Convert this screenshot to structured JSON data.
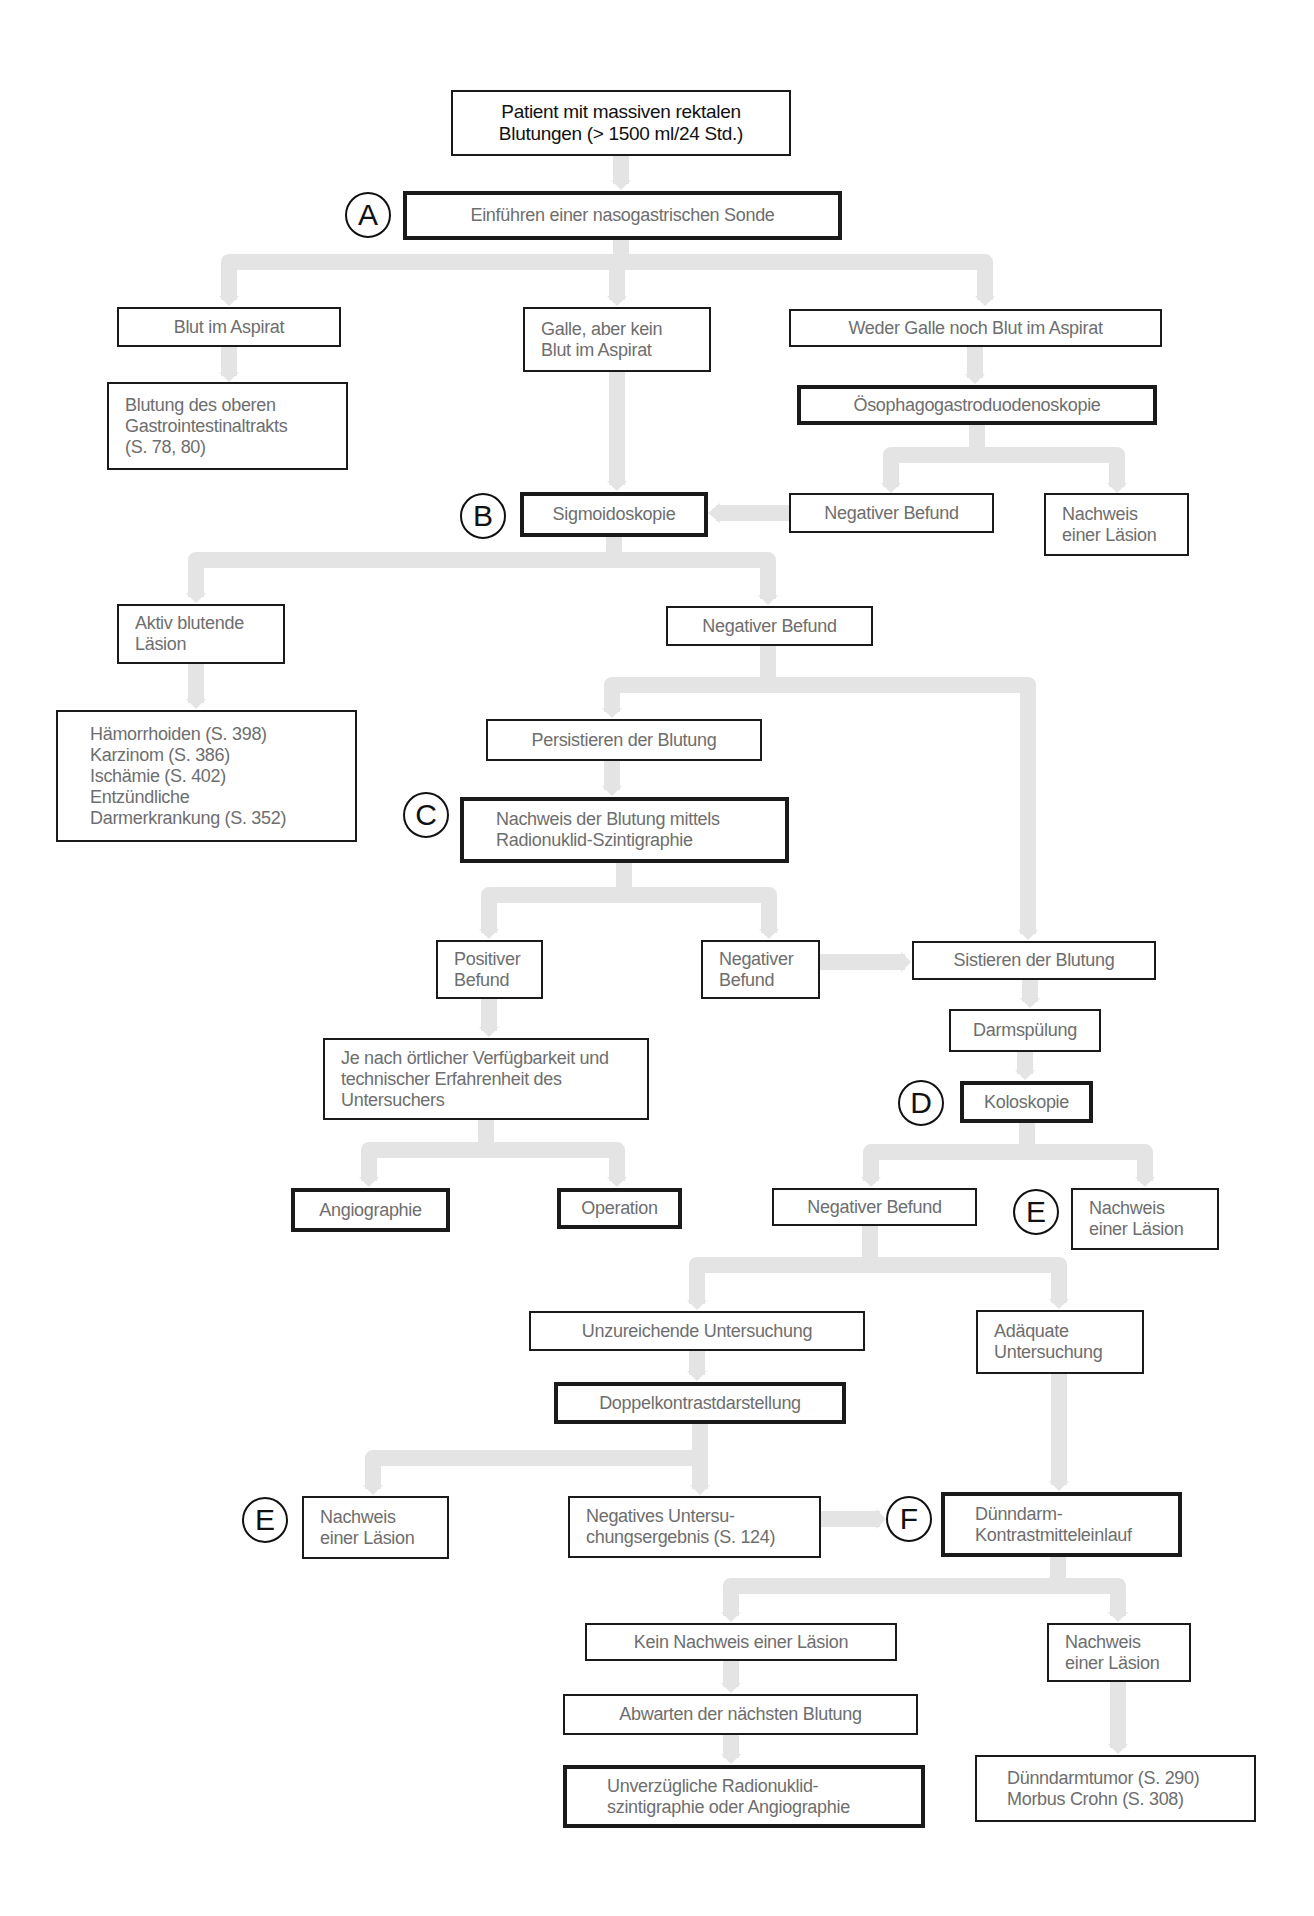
{
  "colors": {
    "connector": "#e4e4e4",
    "border": "#1a1a1a",
    "text": "#6e6e6e"
  },
  "markers": {
    "A": "A",
    "B": "B",
    "C": "C",
    "D": "D",
    "E": "E",
    "F": "F"
  },
  "nodes": {
    "start": "Patient mit massiven rektalen\nBlutungen (> 1500 ml/24 Std.)",
    "nasogastric": "Einführen einer nasogastrischen Sonde",
    "blood_aspirate": "Blut im Aspirat",
    "bile_no_blood": "Galle, aber kein\nBlut im Aspirat",
    "neither": "Weder Galle noch Blut im Aspirat",
    "upper_gi": "Blutung des oberen\nGastrointestinaltrakts\n(S. 78, 80)",
    "egd": "Ösophagogastroduodenoskopie",
    "sigmoidoscopy": "Sigmoidoskopie",
    "egd_negative": "Negativer Befund",
    "egd_lesion": "Nachweis\neiner Läsion",
    "active_lesion": "Aktiv blutende\nLäsion",
    "sigmo_negative": "Negativer Befund",
    "diagnoses_lower": "Hämorrhoiden (S. 398)\nKarzinom (S. 386)\nIschämie (S. 402)\nEntzündliche\n   Darmerkrankung (S. 352)",
    "persisting": "Persistieren der Blutung",
    "scintigraphy": "Nachweis der Blutung mittels\nRadionuklid-Szintigraphie",
    "positive": "Positiver\nBefund",
    "scinti_negative": "Negativer\nBefund",
    "stopped": "Sistieren der Blutung",
    "depending": "Je nach örtlicher Verfügbarkeit und\ntechnischer Erfahrenheit des\nUntersuchers",
    "lavage": "Darmspülung",
    "colonoscopy": "Koloskopie",
    "angiography": "Angiographie",
    "operation": "Operation",
    "colo_negative": "Negativer Befund",
    "colo_lesion": "Nachweis\neiner Läsion",
    "insufficient": "Unzureichende Untersuchung",
    "adequate": "Adäquate\nUntersuchung",
    "double_contrast": "Doppelkontrastdarstellung",
    "dc_lesion": "Nachweis\neiner Läsion",
    "dc_negative": "Negatives Untersu-\nchungsergebnis (S. 124)",
    "small_bowel": "Dünndarm-\nKontrastmitteleinlauf",
    "no_lesion": "Kein Nachweis einer Läsion",
    "sb_lesion": "Nachweis\neiner Läsion",
    "wait": "Abwarten der nächsten Blutung",
    "immediate": "Unverzügliche Radionuklid-\nszintigraphie oder Angiographie",
    "sb_diagnoses": "Dünndarmtumor (S. 290)\nMorbus Crohn (S. 308)"
  }
}
